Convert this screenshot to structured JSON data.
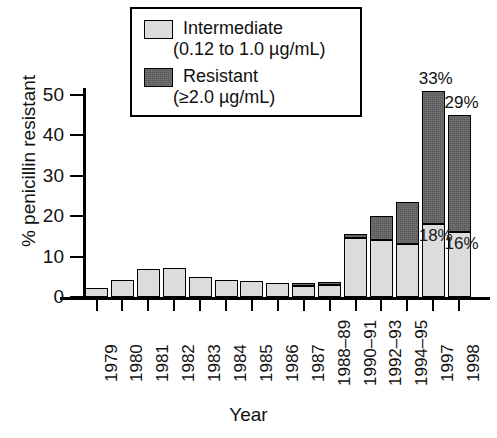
{
  "chart_data": {
    "type": "bar",
    "title": "",
    "xlabel": "Year",
    "ylabel": "% penicillin resistant",
    "ylim": [
      0,
      50
    ],
    "yticks": [
      0,
      10,
      20,
      30,
      40,
      50
    ],
    "grid": false,
    "stacked": true,
    "legend_position": "top-center",
    "categories": [
      "1979",
      "1980",
      "1981",
      "1982",
      "1983",
      "1984",
      "1985",
      "1986",
      "1987",
      "1988–89",
      "1990–91",
      "1992–93",
      "1994–95",
      "1997",
      "1998"
    ],
    "series": [
      {
        "name": "Intermediate",
        "sublabel": "(0.12 to 1.0 µg/mL)",
        "color": "#dcdcdc",
        "values": [
          2.2,
          4.2,
          7.0,
          7.3,
          5.0,
          4.3,
          4.0,
          3.5,
          2.8,
          3.0,
          14.5,
          14.0,
          13.0,
          18.0,
          16.0
        ]
      },
      {
        "name": "Resistant",
        "sublabel": "(≥2.0 µg/mL)",
        "color": "#58585a",
        "values": [
          0,
          0,
          0,
          0,
          0,
          0,
          0,
          0,
          0.4,
          0.5,
          1.0,
          6.0,
          10.5,
          33.0,
          29.0
        ]
      }
    ],
    "annotations": [
      {
        "text": "33%",
        "category": "1997",
        "series": "Resistant",
        "placement": "above-bar"
      },
      {
        "text": "29%",
        "category": "1998",
        "series": "Resistant",
        "placement": "above-bar"
      },
      {
        "text": "18%",
        "category": "1997",
        "series": "Intermediate",
        "placement": "on-segment"
      },
      {
        "text": "16%",
        "category": "1998",
        "series": "Intermediate",
        "placement": "on-segment"
      }
    ]
  },
  "legend": {
    "intermediate_label": "Intermediate",
    "intermediate_range": "(0.12 to 1.0 µg/mL)",
    "resistant_label": "Resistant",
    "resistant_range": "(≥2.0 µg/mL)"
  },
  "axes": {
    "y_title": "% penicillin resistant",
    "x_title": "Year"
  }
}
